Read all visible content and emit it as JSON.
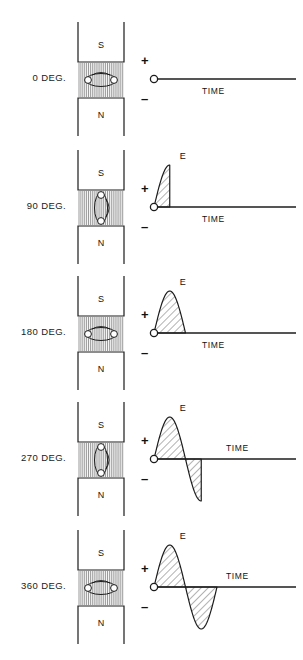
{
  "figure": {
    "colors": {
      "ink": "#1c1c1c",
      "background": "#ffffff",
      "hatch": "#4a4a4a",
      "flux": "#6e6e6e"
    }
  },
  "axis": {
    "plus_sign": "+",
    "minus_sign": "–",
    "time_label": "TIME",
    "emf_label": "E"
  },
  "poles": {
    "top": "S",
    "bottom": "N"
  },
  "rows": [
    {
      "degree_label": "0 DEG.",
      "degrees": 0,
      "coil_orientation": "horizontal",
      "time_label_position": "below-axis",
      "emf_label_shown": false,
      "waveform": "flat"
    },
    {
      "degree_label": "90 DEG.",
      "degrees": 90,
      "coil_orientation": "vertical",
      "time_label_position": "below-axis",
      "emf_label_shown": true,
      "waveform": "quarter-rise-positive"
    },
    {
      "degree_label": "180 DEG.",
      "degrees": 180,
      "coil_orientation": "horizontal",
      "time_label_position": "below-axis",
      "emf_label_shown": true,
      "waveform": "positive-half-lobe"
    },
    {
      "degree_label": "270 DEG.",
      "degrees": 270,
      "coil_orientation": "vertical",
      "time_label_position": "above-axis",
      "emf_label_shown": true,
      "waveform": "positive-half-plus-negative-quarter"
    },
    {
      "degree_label": "360 DEG.",
      "degrees": 360,
      "coil_orientation": "horizontal",
      "time_label_position": "above-axis",
      "emf_label_shown": true,
      "waveform": "full-sine-cycle"
    }
  ],
  "chart_data": {
    "type": "line",
    "xlabel": "TIME",
    "ylabel": "E",
    "ylim": [
      -1,
      1
    ],
    "grid": false,
    "legend": null,
    "series": [
      {
        "name": "0 DEG.",
        "phase_end_deg": 0,
        "x": [
          0,
          90,
          180,
          270,
          360
        ],
        "values": [
          0,
          0,
          0,
          0,
          0
        ]
      },
      {
        "name": "90 DEG.",
        "phase_end_deg": 90,
        "x": [
          0,
          30,
          60,
          90
        ],
        "values": [
          0,
          0.5,
          0.87,
          1.0
        ]
      },
      {
        "name": "180 DEG.",
        "phase_end_deg": 180,
        "x": [
          0,
          45,
          90,
          135,
          180
        ],
        "values": [
          0,
          0.71,
          1.0,
          0.71,
          0
        ]
      },
      {
        "name": "270 DEG.",
        "phase_end_deg": 270,
        "x": [
          0,
          45,
          90,
          135,
          180,
          225,
          270
        ],
        "values": [
          0,
          0.71,
          1.0,
          0.71,
          0,
          -0.71,
          -1.0
        ]
      },
      {
        "name": "360 DEG.",
        "phase_end_deg": 360,
        "x": [
          0,
          45,
          90,
          135,
          180,
          225,
          270,
          315,
          360
        ],
        "values": [
          0,
          0.71,
          1.0,
          0.71,
          0,
          -0.71,
          -1.0,
          -0.71,
          0
        ]
      }
    ]
  }
}
